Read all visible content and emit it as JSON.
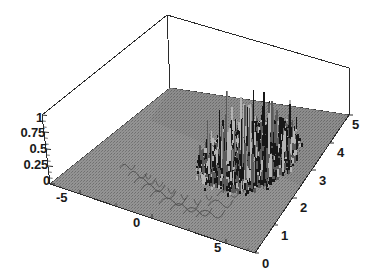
{
  "chart_data": {
    "type": "surface3d",
    "title": "",
    "xlabel": "",
    "ylabel": "",
    "zlabel": "",
    "grid": false,
    "legend": "none",
    "x_axis": {
      "name": "x-axis-front-left",
      "ticks": [
        "-5",
        "0",
        "5"
      ],
      "values": [
        -5,
        0,
        5
      ],
      "range": [
        -7,
        7
      ]
    },
    "y_axis": {
      "name": "y-axis-front-right",
      "ticks": [
        "0",
        "1",
        "2",
        "3",
        "4",
        "5"
      ],
      "values": [
        0,
        1,
        2,
        3,
        4,
        5
      ],
      "range": [
        0,
        5.5
      ]
    },
    "z_axis": {
      "name": "z-axis-vertical-left",
      "ticks": [
        "1",
        "0.75",
        "0.5",
        "0.25",
        "0"
      ],
      "values": [
        1,
        0.75,
        0.5,
        0.25,
        0
      ],
      "range": [
        0,
        1
      ]
    },
    "surface": {
      "base_plane_z": 0,
      "peak_z": 1,
      "spike_region_x": [
        -1,
        6
      ],
      "spike_region_y": [
        1.5,
        5
      ],
      "ripple_region_x": [
        -2,
        3
      ],
      "ripple_region_y": [
        0,
        1.5
      ]
    }
  },
  "axes": {
    "z_ticks": [
      {
        "label": "1",
        "value": 1
      },
      {
        "label": "0.75",
        "value": 0.75
      },
      {
        "label": "0.5",
        "value": 0.5
      },
      {
        "label": "0.25",
        "value": 0.25
      },
      {
        "label": "0",
        "value": 0
      }
    ],
    "x_ticks": [
      {
        "label": "-5",
        "value": -5
      },
      {
        "label": "0",
        "value": 0
      },
      {
        "label": "5",
        "value": 5
      }
    ],
    "y_ticks": [
      {
        "label": "0",
        "value": 0
      },
      {
        "label": "1",
        "value": 1
      },
      {
        "label": "2",
        "value": 2
      },
      {
        "label": "3",
        "value": 3
      },
      {
        "label": "4",
        "value": 4
      },
      {
        "label": "5",
        "value": 5
      }
    ]
  },
  "colors": {
    "background": "#ffffff",
    "box_line": "#2b2b2b",
    "floor_gray": "#8d8d8d",
    "floor_gray_dark": "#7a7a7a",
    "spike_dark": "#171717",
    "spike_mid": "#5a5a5a",
    "spike_light": "#b4b4b4",
    "label_text": "#1a1a1a"
  }
}
